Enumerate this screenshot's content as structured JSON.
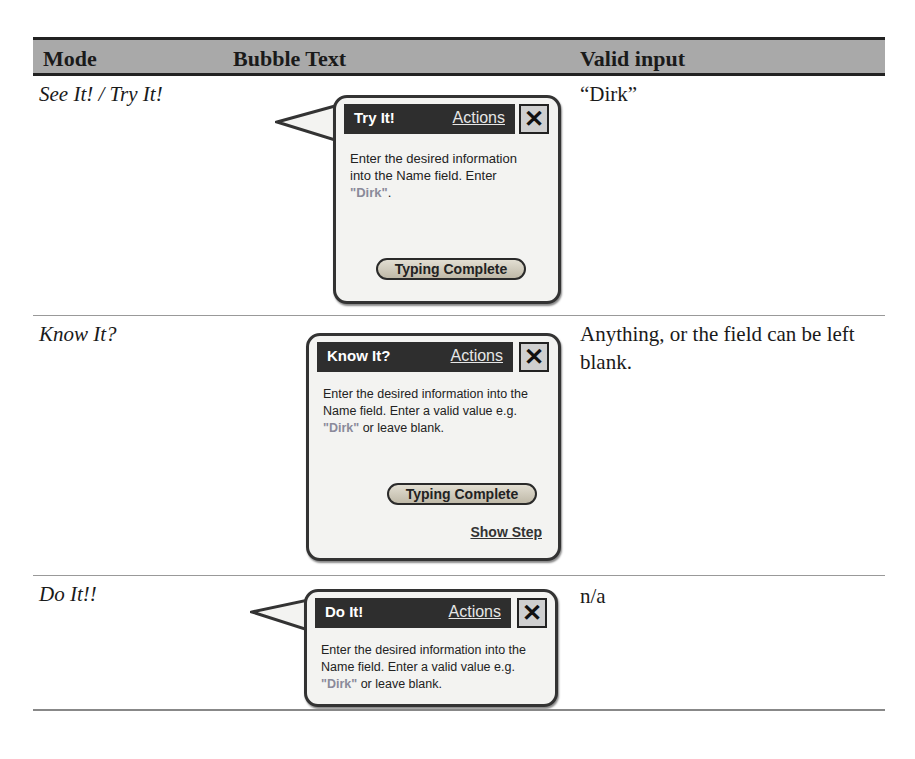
{
  "table": {
    "headers": {
      "mode": "Mode",
      "bubble_text": "Bubble Text",
      "valid_input": "Valid input"
    },
    "rows": [
      {
        "mode": "See It! / Try It!",
        "valid_input": "“Dirk”",
        "bubble": {
          "title": "Try It!",
          "actions": "Actions",
          "close": "✕",
          "body_pre": "Enter the desired information into the Name field. Enter ",
          "highlight": "\"Dirk\"",
          "body_post": ".",
          "button": "Typing Complete"
        }
      },
      {
        "mode": "Know It?",
        "valid_input": "Anything, or the field can be left blank.",
        "bubble": {
          "title": "Know It?",
          "actions": "Actions",
          "close": "✕",
          "body_pre": "Enter the desired information into the Name field. Enter a valid value e.g. ",
          "highlight": "\"Dirk\"",
          "body_post": " or leave blank.",
          "button": "Typing Complete",
          "link": "Show Step"
        }
      },
      {
        "mode": "Do It!!",
        "valid_input": "n/a",
        "bubble": {
          "title": "Do It!",
          "actions": "Actions",
          "close": "✕",
          "body_pre": "Enter the desired information into the Name field. Enter a valid value e.g. ",
          "highlight": "\"Dirk\"",
          "body_post": " or leave blank."
        }
      }
    ]
  }
}
